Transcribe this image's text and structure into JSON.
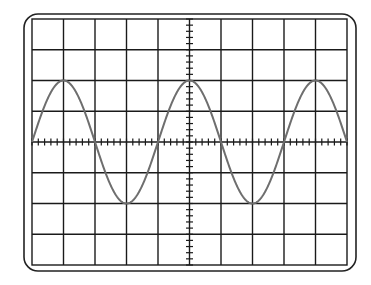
{
  "diagram": {
    "type": "oscilloscope-screen",
    "grid": {
      "columns": 10,
      "rows": 8,
      "minor_ticks_per_division": 5
    },
    "trace": {
      "waveform": "sine",
      "amplitude_divisions": 2,
      "period_divisions": 4,
      "phase_start": "zero-crossing-rising",
      "cycles_visible": 2.5
    },
    "colors": {
      "background": "#ffffff",
      "bezel": "#222222",
      "grid": "#1a1a1a",
      "trace": "#6e6e6e"
    }
  }
}
